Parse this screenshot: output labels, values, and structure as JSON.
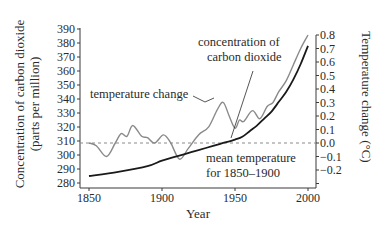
{
  "chart_data": {
    "type": "line",
    "title": "",
    "xlabel": "Year",
    "ylabel": "Concentration of carbon dioxide (parts per million)",
    "ylabel_line1": "Concentration of carbon dioxide",
    "ylabel_line2": "(parts per million)",
    "y2label": "Temperature change (°C)",
    "xlim": [
      1845,
      2005
    ],
    "ylim": [
      280,
      390
    ],
    "y2lim": [
      -0.2,
      0.8
    ],
    "x_ticks": [
      1850,
      1900,
      1950,
      2000
    ],
    "y_ticks": [
      280,
      290,
      300,
      310,
      320,
      330,
      340,
      350,
      360,
      370,
      380,
      390
    ],
    "y2_ticks": [
      "0.8",
      "0.7",
      "0.6",
      "0.5",
      "0.4",
      "0.3",
      "0.2",
      "0.1",
      "0.0",
      "−0.1",
      "−0.2"
    ],
    "y2_tick_values": [
      0.8,
      0.7,
      0.6,
      0.5,
      0.4,
      0.3,
      0.2,
      0.1,
      0.0,
      -0.1,
      -0.2
    ],
    "grid": false,
    "series": [
      {
        "name": "concentration of carbon dioxide",
        "axis": "left",
        "color": "#1a1a1a",
        "x": [
          1850,
          1870,
          1890,
          1900,
          1910,
          1920,
          1930,
          1940,
          1950,
          1955,
          1960,
          1965,
          1970,
          1975,
          1980,
          1985,
          1990,
          1995,
          2000
        ],
        "values": [
          285,
          288,
          292,
          296,
          299,
          302,
          305,
          308,
          311,
          313,
          317,
          321,
          326,
          331,
          338,
          345,
          354,
          365,
          378
        ]
      },
      {
        "name": "temperature change",
        "axis": "right",
        "color": "#8a8a8a",
        "x": [
          1850,
          1855,
          1862,
          1868,
          1872,
          1876,
          1880,
          1886,
          1890,
          1895,
          1901,
          1906,
          1912,
          1918,
          1925,
          1932,
          1938,
          1942,
          1946,
          1950,
          1953,
          1956,
          1962,
          1967,
          1972,
          1976,
          1980,
          1985,
          1990,
          1995,
          2000
        ],
        "values": [
          0.0,
          -0.02,
          -0.1,
          0.0,
          0.07,
          0.05,
          0.13,
          0.05,
          0.04,
          0.0,
          0.06,
          0.0,
          -0.12,
          -0.04,
          0.06,
          0.12,
          0.25,
          0.3,
          0.2,
          0.11,
          0.17,
          0.16,
          0.24,
          0.18,
          0.27,
          0.3,
          0.38,
          0.46,
          0.58,
          0.7,
          0.8
        ]
      }
    ],
    "reference_line": {
      "name": "mean temperature for 1850–1900",
      "axis": "right",
      "value": 0.0,
      "style": "dashed"
    },
    "annotations": [
      {
        "text_lines": [
          "concentration of",
          "carbon dioxide"
        ],
        "points_to": "concentration of carbon dioxide"
      },
      {
        "text_lines": [
          "temperature change"
        ],
        "points_to": "temperature change"
      },
      {
        "text_lines": [
          "mean temperature",
          "for 1850–1900"
        ],
        "points_to": "reference line"
      }
    ]
  }
}
